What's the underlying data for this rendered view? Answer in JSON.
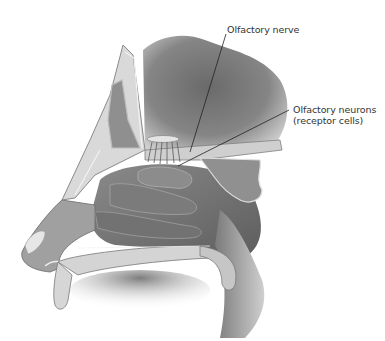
{
  "diagram": {
    "type": "anatomical-illustration",
    "style": "grayscale",
    "labels": [
      {
        "id": "olfactory-nerve",
        "lines": [
          "Olfactory nerve"
        ]
      },
      {
        "id": "olfactory-neurons",
        "lines": [
          "Olfactory neurons",
          "(receptor cells)"
        ]
      }
    ],
    "colors": {
      "background": "#ffffff",
      "label_text": "#333333",
      "leader_line": "#222222",
      "tissue_dark": "#6e6e6e",
      "tissue_mid": "#9a9a9a",
      "tissue_light": "#c8c8c8",
      "bone": "#dcdcdc"
    }
  }
}
